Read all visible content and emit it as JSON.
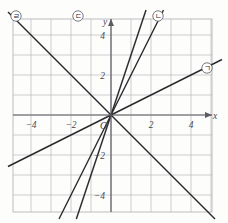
{
  "figure": {
    "background_color": "#fdfdfc",
    "grid_color": "#b9b7bb",
    "axis_color": "#5b5b61",
    "line_color": "#2a2a2e"
  },
  "axes": {
    "x_label": "x",
    "y_label": "y",
    "origin_label": "O",
    "x_ticks": [
      {
        "value": -4,
        "label": "−4"
      },
      {
        "value": -2,
        "label": "−2"
      },
      {
        "value": 2,
        "label": "2"
      },
      {
        "value": 4,
        "label": "4"
      }
    ],
    "y_ticks": [
      {
        "value": 4,
        "label": "4"
      },
      {
        "value": 2,
        "label": "2"
      },
      {
        "value": -2,
        "label": "−2"
      },
      {
        "value": -4,
        "label": "−4"
      }
    ],
    "xlim": [
      -5,
      5
    ],
    "ylim": [
      -5,
      5
    ],
    "grid": true,
    "grid_step": 1
  },
  "lines": [
    {
      "id": "line-r",
      "callout": "ㄹ",
      "slope": -1,
      "intercept": 0,
      "callout_x": 16,
      "callout_y": 16,
      "description": "steep negative slope line through origin"
    },
    {
      "id": "line-d",
      "callout": "ㄷ",
      "slope": 3,
      "intercept": 0,
      "callout_x": 78,
      "callout_y": 16,
      "description": "steep positive slope line through origin"
    },
    {
      "id": "line-n",
      "callout": "ㄴ",
      "slope": 2,
      "intercept": 0,
      "callout_x": 158,
      "callout_y": 16,
      "description": "positive slope line through origin"
    },
    {
      "id": "line-g",
      "callout": "ㄱ",
      "slope": 0.5,
      "intercept": 0,
      "callout_x": 207,
      "callout_y": 68,
      "description": "shallow positive slope line through origin"
    }
  ],
  "chart_data": {
    "type": "line",
    "xlabel": "x",
    "ylabel": "y",
    "xlim": [
      -5,
      5
    ],
    "ylim": [
      -5,
      5
    ],
    "grid": true,
    "legend_position": "callouts-outside-plot",
    "series": [
      {
        "name": "ㄹ",
        "equation": "y = -x",
        "slope": -1,
        "intercept": 0
      },
      {
        "name": "ㄷ",
        "equation": "y = 3x",
        "slope": 3,
        "intercept": 0
      },
      {
        "name": "ㄴ",
        "equation": "y = 2x",
        "slope": 2,
        "intercept": 0
      },
      {
        "name": "ㄱ",
        "equation": "y = 0.5x",
        "slope": 0.5,
        "intercept": 0
      }
    ]
  }
}
